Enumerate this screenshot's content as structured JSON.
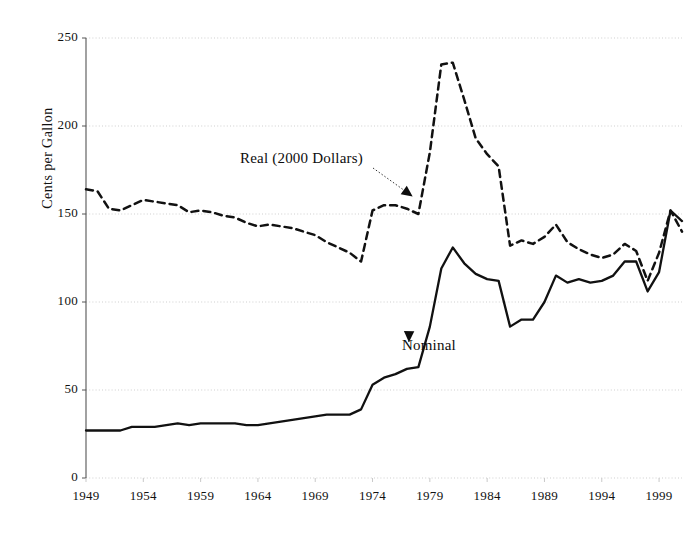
{
  "chart_data": {
    "type": "line",
    "title": "",
    "xlabel": "",
    "ylabel": "Cents per Gallon",
    "xlim": [
      1949,
      2001
    ],
    "ylim": [
      0,
      250
    ],
    "ytick_values": [
      0,
      50,
      100,
      150,
      200,
      250
    ],
    "xtick_values": [
      1949,
      1954,
      1959,
      1964,
      1969,
      1974,
      1979,
      1984,
      1989,
      1994,
      1999
    ],
    "grid": "horizontal-dotted",
    "legend": "inline-annotations",
    "x": [
      1949,
      1950,
      1951,
      1952,
      1953,
      1954,
      1955,
      1956,
      1957,
      1958,
      1959,
      1960,
      1961,
      1962,
      1963,
      1964,
      1965,
      1966,
      1967,
      1968,
      1969,
      1970,
      1971,
      1972,
      1973,
      1974,
      1975,
      1976,
      1977,
      1978,
      1979,
      1980,
      1981,
      1982,
      1983,
      1984,
      1985,
      1986,
      1987,
      1988,
      1989,
      1990,
      1991,
      1992,
      1993,
      1994,
      1995,
      1996,
      1997,
      1998,
      1999,
      2000,
      2001
    ],
    "series": [
      {
        "name": "Real (2000 Dollars)",
        "style": "dashed",
        "color": "#111111",
        "values": [
          164,
          163,
          153,
          152,
          155,
          158,
          157,
          156,
          155,
          151,
          152,
          151,
          149,
          148,
          145,
          143,
          144,
          143,
          142,
          140,
          138,
          134,
          131,
          128,
          123,
          152,
          155,
          155,
          153,
          150,
          185,
          235,
          236,
          215,
          193,
          184,
          177,
          132,
          135,
          133,
          137,
          144,
          134,
          130,
          127,
          125,
          127,
          133,
          129,
          112,
          128,
          152,
          140
        ]
      },
      {
        "name": "Nominal",
        "style": "solid",
        "color": "#111111",
        "values": [
          27,
          27,
          27,
          27,
          29,
          29,
          29,
          30,
          31,
          30,
          31,
          31,
          31,
          31,
          30,
          30,
          31,
          32,
          33,
          34,
          35,
          36,
          36,
          36,
          39,
          53,
          57,
          59,
          62,
          63,
          86,
          119,
          131,
          122,
          116,
          113,
          112,
          86,
          90,
          90,
          100,
          115,
          111,
          113,
          111,
          112,
          115,
          123,
          123,
          106,
          117,
          152,
          146
        ]
      }
    ],
    "annotations": [
      {
        "id": "real-label",
        "text": "Real (2000 Dollars)",
        "arrow_to": [
          1977.5,
          160
        ]
      },
      {
        "id": "nominal-label",
        "text": "Nominal",
        "arrow_to": [
          1977.0,
          80
        ]
      }
    ]
  },
  "axis": {
    "y_title": "Cents per Gallon",
    "y_ticks": [
      "250",
      "200",
      "150",
      "100",
      "50",
      "0"
    ],
    "x_ticks": [
      "1949",
      "1954",
      "1959",
      "1964",
      "1969",
      "1974",
      "1979",
      "1984",
      "1989",
      "1994",
      "1999"
    ]
  },
  "annotations": {
    "real": "Real (2000 Dollars)",
    "nominal": "Nominal"
  },
  "style": {
    "line_color": "#111111",
    "grid_color": "#c9c9c9",
    "axis_color": "#555555",
    "background": "#ffffff"
  }
}
